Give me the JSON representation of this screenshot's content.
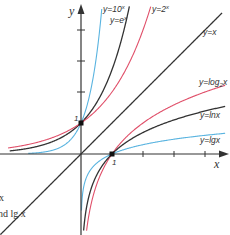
{
  "chart_data": {
    "type": "line",
    "title": "",
    "xlabel": "x",
    "ylabel": "y",
    "grid": false,
    "xlim": [
      -2.6,
      4.6
    ],
    "ylim": [
      -2.6,
      4.8
    ],
    "x_ticks": [
      1,
      2,
      3,
      4
    ],
    "y_ticks": [
      1,
      2,
      3,
      4
    ],
    "tick_labels": {
      "x_one": "1",
      "y_one": "1"
    },
    "marked_points": [
      [
        0,
        1
      ],
      [
        1,
        0
      ]
    ],
    "series": [
      {
        "name": "y=10^x",
        "label_base": "y=10",
        "label_sup": "x",
        "fn": "pow10",
        "color": "#5ab4e0"
      },
      {
        "name": "y=e^x",
        "label_base": "y=e",
        "label_sup": "x",
        "fn": "exp",
        "color": "#333333"
      },
      {
        "name": "y=2^x",
        "label_base": "y=2",
        "label_sup": "x",
        "fn": "pow2",
        "color": "#e0506a"
      },
      {
        "name": "y=x",
        "label_base": "y=x",
        "fn": "identity",
        "color": "#333333"
      },
      {
        "name": "y=log2 x",
        "label_base": "y=log",
        "label_sub": "2",
        "label_tail": "x",
        "fn": "log2",
        "color": "#e0506a"
      },
      {
        "name": "y=ln x",
        "label_base": "y=lnx",
        "fn": "ln",
        "color": "#333333"
      },
      {
        "name": "y=lg x",
        "label_base": "y=lgx",
        "fn": "lg",
        "color": "#5ab4e0"
      }
    ],
    "caption_fragments": [
      "x",
      "nd lg x"
    ]
  },
  "labels": {
    "y_axis": "y",
    "x_axis": "x",
    "one_y": "1",
    "one_x": "1",
    "pow10_base": "y=10",
    "pow10_sup": "x",
    "exp_base": "y=e",
    "exp_sup": "x",
    "pow2_base": "y=2",
    "pow2_sup": "x",
    "identity": "y=x",
    "log2_base": "y=log",
    "log2_sub": "2",
    "log2_tail": "x",
    "ln": "y=lnx",
    "lg": "y=lgx",
    "caption_line1": "x",
    "caption_line2": "nd lg x"
  },
  "colors": {
    "axis": "#333333",
    "blue": "#5ab4e0",
    "black": "#333333",
    "red": "#e0506a"
  }
}
